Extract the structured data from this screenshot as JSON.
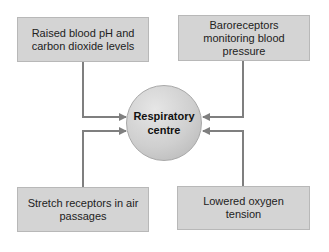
{
  "diagram": {
    "center": {
      "label_line1": "Respiratory",
      "label_line2": "centre"
    },
    "inputs": [
      {
        "position": "top-left",
        "text": "Raised blood pH and carbon dioxide levels"
      },
      {
        "position": "top-right",
        "text": "Baroreceptors monitoring blood pressure"
      },
      {
        "position": "bottom-left",
        "text": "Stretch receptors in air passages"
      },
      {
        "position": "bottom-right",
        "text": "Lowered oxygen tension"
      }
    ],
    "colors": {
      "box_fill": "#d4d4d4",
      "arrow": "#7f7f7f",
      "circle": "#cfcfcf"
    }
  }
}
